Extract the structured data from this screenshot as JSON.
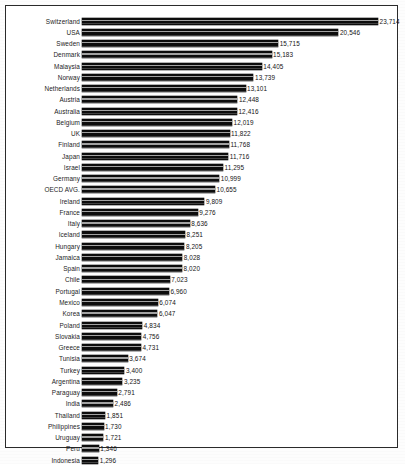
{
  "chart_data": {
    "type": "bar",
    "orientation": "horizontal",
    "title": "",
    "subtitle": "",
    "xlabel": "",
    "ylabel": "",
    "grid": false,
    "legend": null,
    "axis_visible": false,
    "tick_labels": [],
    "xlim": [
      0,
      23714
    ],
    "value_label_format": "comma-separated thousands",
    "bar_color": "#0d0d0d",
    "frame_color": "#2a2a2a",
    "background_color": "#ffffff",
    "categories": [
      "Switzerland",
      "USA",
      "Sweden",
      "Denmark",
      "Malaysia",
      "Norway",
      "Netherlands",
      "Austria",
      "Australia",
      "Belgium",
      "UK",
      "Finland",
      "Japan",
      "Israel",
      "Germany",
      "OECD AVG.",
      "Ireland",
      "France",
      "Italy",
      "Iceland",
      "Hungary",
      "Jamaica",
      "Spain",
      "Chile",
      "Portugal",
      "Mexico",
      "Korea",
      "Poland",
      "Slovakia",
      "Greece",
      "Tunisia",
      "Turkey",
      "Argentina",
      "Paraguay",
      "India",
      "Thailand",
      "Philippines",
      "Uruguay",
      "Peru",
      "Indonesia"
    ],
    "values": [
      23714,
      20546,
      15715,
      15183,
      14405,
      13739,
      13101,
      12448,
      12416,
      12019,
      11822,
      11768,
      11716,
      11295,
      10999,
      10655,
      9809,
      9276,
      8636,
      8251,
      8205,
      8028,
      8020,
      7023,
      6960,
      6074,
      6047,
      4834,
      4756,
      4731,
      3674,
      3400,
      3235,
      2791,
      2486,
      1851,
      1730,
      1721,
      1346,
      1296
    ],
    "value_labels": [
      "23,714",
      "20,546",
      "15,715",
      "15,183",
      "14,405",
      "13,739",
      "13,101",
      "12,448",
      "12,416",
      "12,019",
      "11,822",
      "11,768",
      "11,716",
      "11,295",
      "10,999",
      "10,655",
      "9,809",
      "9,276",
      "8,636",
      "8,251",
      "8,205",
      "8,028",
      "8,020",
      "7,023",
      "6,960",
      "6,074",
      "6,047",
      "4,834",
      "4,756",
      "4,731",
      "3,674",
      "3,400",
      "3,235",
      "2,791",
      "2,486",
      "1,851",
      "1,730",
      "1,721",
      "1,346",
      "1,296"
    ]
  }
}
